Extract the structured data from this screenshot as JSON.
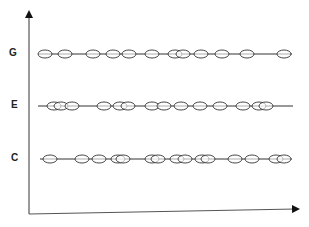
{
  "diagram": {
    "title": "",
    "y_axis": {
      "x": 29,
      "y_top": 14,
      "y_bottom": 214,
      "arrow": "up"
    },
    "x_axis": {
      "y_left": 214,
      "x_left": 29,
      "x_right": 296,
      "y_right": 209,
      "arrow": "right"
    },
    "rows": [
      {
        "label": "G",
        "y": 54,
        "label_x": 9,
        "line_start": 38,
        "line_end": 292,
        "ovals": [
          45,
          65,
          93,
          113,
          129,
          152,
          175,
          183,
          201,
          222,
          247,
          284
        ]
      },
      {
        "label": "E",
        "y": 106,
        "label_x": 11,
        "line_start": 38,
        "line_end": 293,
        "ovals": [
          54,
          61,
          72,
          104,
          120,
          128,
          152,
          164,
          181,
          200,
          220,
          243,
          259,
          266
        ]
      },
      {
        "label": "C",
        "y": 159,
        "label_x": 11,
        "line_start": 40,
        "line_end": 292,
        "ovals": [
          50,
          82,
          99,
          118,
          123,
          152,
          158,
          177,
          185,
          202,
          208,
          235,
          252,
          276,
          284
        ]
      }
    ],
    "oval_rx": 7,
    "oval_ry": 4,
    "stroke_color": "#333333",
    "fill_color": "#ffffff"
  }
}
